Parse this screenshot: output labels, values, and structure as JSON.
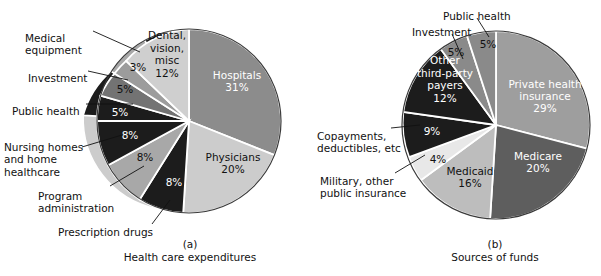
{
  "figure": {
    "background": "#ffffff",
    "text_color": "#111111"
  },
  "panels": [
    {
      "key": "(a)",
      "title": "Health care expenditures",
      "center": {
        "x": 189,
        "y": 121
      },
      "radius": 92
    },
    {
      "key": "(b)",
      "title": "Sources of funds",
      "center": {
        "x": 496,
        "y": 125
      },
      "radius": 94
    }
  ],
  "chart_data": [
    {
      "type": "pie",
      "title": "Health care expenditures",
      "subtitle": "(a)",
      "start_angle_deg": 0,
      "direction": "clockwise",
      "categories": [
        "Hospitals",
        "Physicians",
        "Prescription drugs",
        "Program administration",
        "Nursing homes and home healthcare",
        "Public health",
        "Investment",
        "Medical equipment",
        "Dental, vision, misc"
      ],
      "values": [
        31,
        20,
        8,
        8,
        8,
        5,
        5,
        3,
        12
      ],
      "value_labels": [
        "31%",
        "20%",
        "8%",
        "8%",
        "8%",
        "5%",
        "5%",
        "3%",
        "12%"
      ],
      "colors": [
        "#8c8c8c",
        "#cccccc",
        "#1c1c1c",
        "#a8a8a8",
        "#1c1c1c",
        "#1c1c1c",
        "#737373",
        "#9c9c9c",
        "#cfcfcf"
      ],
      "label_placement": [
        "inside",
        "inside",
        "inside",
        "inside",
        "inside",
        "inside-with-callout",
        "callout",
        "callout",
        "inside"
      ],
      "legend": "none"
    },
    {
      "type": "pie",
      "title": "Sources of funds",
      "subtitle": "(b)",
      "start_angle_deg": 0,
      "direction": "clockwise",
      "categories": [
        "Private health insurance",
        "Medicare",
        "Medicaid",
        "Military, other public insurance",
        "Copayments, deductibles, etc",
        "Other third-party payers",
        "Investment",
        "Public health"
      ],
      "values": [
        29,
        20,
        16,
        4,
        9,
        12,
        5,
        5
      ],
      "value_labels": [
        "29%",
        "20%",
        "16%",
        "4%",
        "9%",
        "12%",
        "5%",
        "5%"
      ],
      "colors": [
        "#9e9e9e",
        "#5e5e5e",
        "#bdbdbd",
        "#e8e8e8",
        "#1c1c1c",
        "#1c1c1c",
        "#8a8a8a",
        "#8a8a8a"
      ],
      "label_placement": [
        "inside",
        "inside",
        "inside",
        "callout",
        "callout",
        "inside",
        "callout",
        "callout"
      ],
      "legend": "none"
    }
  ],
  "panel_a": {
    "key": "(a)",
    "title": "Health care expenditures",
    "inside_labels": [
      {
        "name": "hospitals",
        "lines": [
          "Hospitals",
          "31%"
        ],
        "x": 237,
        "y": 82,
        "tone": "light"
      },
      {
        "name": "physicians",
        "lines": [
          "Physicians",
          "20%"
        ],
        "x": 233,
        "y": 164,
        "tone": "dark"
      },
      {
        "name": "dental-vision-misc",
        "lines": [
          "Dental,",
          "vision,",
          "misc",
          "12%"
        ],
        "x": 167,
        "y": 55,
        "tone": "dark"
      },
      {
        "name": "prescription-drugs-pct",
        "lines": [
          "8%"
        ],
        "x": 174,
        "y": 183,
        "tone": "light"
      },
      {
        "name": "program-administration-pct",
        "lines": [
          "8%"
        ],
        "x": 145,
        "y": 158,
        "tone": "dark"
      },
      {
        "name": "nursing-homes-pct",
        "lines": [
          "8%"
        ],
        "x": 130,
        "y": 136,
        "tone": "light"
      },
      {
        "name": "public-health-pct",
        "lines": [
          "5%"
        ],
        "x": 120,
        "y": 113,
        "tone": "light"
      },
      {
        "name": "investment-pct",
        "lines": [
          "5%"
        ],
        "x": 125,
        "y": 90,
        "tone": "dark"
      },
      {
        "name": "medical-equipment-pct",
        "lines": [
          "3%"
        ],
        "x": 138,
        "y": 68,
        "tone": "dark"
      }
    ],
    "callouts": [
      {
        "name": "medical-equipment",
        "lines": [
          "Medical",
          "equipment"
        ],
        "x": 25,
        "y": 34,
        "anchor": "start"
      },
      {
        "name": "investment",
        "lines": [
          "Investment"
        ],
        "x": 28,
        "y": 74,
        "anchor": "start"
      },
      {
        "name": "public-health",
        "lines": [
          "Public health"
        ],
        "x": 12,
        "y": 107,
        "anchor": "start"
      },
      {
        "name": "nursing-homes-home-healthcare",
        "lines": [
          "Nursing homes",
          "and home",
          "healthcare"
        ],
        "x": 4,
        "y": 143,
        "anchor": "start"
      },
      {
        "name": "program-administration",
        "lines": [
          "Program",
          "administration"
        ],
        "x": 38,
        "y": 192,
        "anchor": "start"
      },
      {
        "name": "prescription-drugs",
        "lines": [
          "Prescription drugs"
        ],
        "x": 58,
        "y": 228,
        "anchor": "start"
      }
    ]
  },
  "panel_b": {
    "key": "(b)",
    "title": "Sources of funds",
    "inside_labels": [
      {
        "name": "private-health-insurance",
        "lines": [
          "Private health",
          "insurance",
          "29%"
        ],
        "x": 545,
        "y": 97,
        "tone": "light"
      },
      {
        "name": "medicare",
        "lines": [
          "Medicare",
          "20%"
        ],
        "x": 538,
        "y": 163,
        "tone": "light"
      },
      {
        "name": "medicaid",
        "lines": [
          "Medicaid",
          "16%"
        ],
        "x": 470,
        "y": 178,
        "tone": "dark"
      },
      {
        "name": "other-third-party-payers",
        "lines": [
          "Other",
          "third-party",
          "payers",
          "12%"
        ],
        "x": 445,
        "y": 80,
        "tone": "light"
      },
      {
        "name": "copayments-pct",
        "lines": [
          "9%"
        ],
        "x": 432,
        "y": 132,
        "tone": "light"
      },
      {
        "name": "military-pct",
        "lines": [
          "4%"
        ],
        "x": 438,
        "y": 160,
        "tone": "dark"
      },
      {
        "name": "investment-pct-b",
        "lines": [
          "5%"
        ],
        "x": 456,
        "y": 53,
        "tone": "dark"
      },
      {
        "name": "public-health-pct-b",
        "lines": [
          "5%"
        ],
        "x": 488,
        "y": 45,
        "tone": "dark"
      }
    ],
    "callouts": [
      {
        "name": "public-health-b",
        "lines": [
          "Public health"
        ],
        "x": 443,
        "y": 12,
        "anchor": "start"
      },
      {
        "name": "investment-b",
        "lines": [
          "Investment"
        ],
        "x": 412,
        "y": 28,
        "anchor": "start"
      },
      {
        "name": "copayments-deductibles",
        "lines": [
          "Copayments,",
          "deductibles, etc"
        ],
        "x": 317,
        "y": 132,
        "anchor": "start"
      },
      {
        "name": "military-other-public-insurance",
        "lines": [
          "Military, other",
          "public insurance"
        ],
        "x": 320,
        "y": 177,
        "anchor": "start"
      }
    ]
  }
}
